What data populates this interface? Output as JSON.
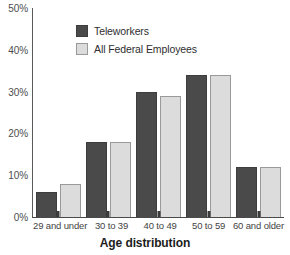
{
  "chart_data": {
    "type": "bar",
    "title": "",
    "xlabel": "Age distribution",
    "ylabel": "",
    "categories": [
      "29 and under",
      "30 to 39",
      "40 to 49",
      "50 to 59",
      "60 and older"
    ],
    "series": [
      {
        "name": "Teleworkers",
        "color": "#4a4a4a",
        "values": [
          6,
          18,
          30,
          34,
          12
        ]
      },
      {
        "name": "All Federal Employees",
        "color": "#dcdcdc",
        "values": [
          8,
          18,
          29,
          34,
          12
        ]
      }
    ],
    "ylim": [
      0,
      50
    ],
    "ytick_values": [
      0,
      10,
      20,
      30,
      40,
      50
    ],
    "ytick_labels": [
      "0%",
      "10%",
      "20%",
      "30%",
      "40%",
      "50%"
    ],
    "grid": false,
    "legend_position": "top-center-inside",
    "legend": [
      "Teleworkers",
      "All Federal Employees"
    ]
  }
}
